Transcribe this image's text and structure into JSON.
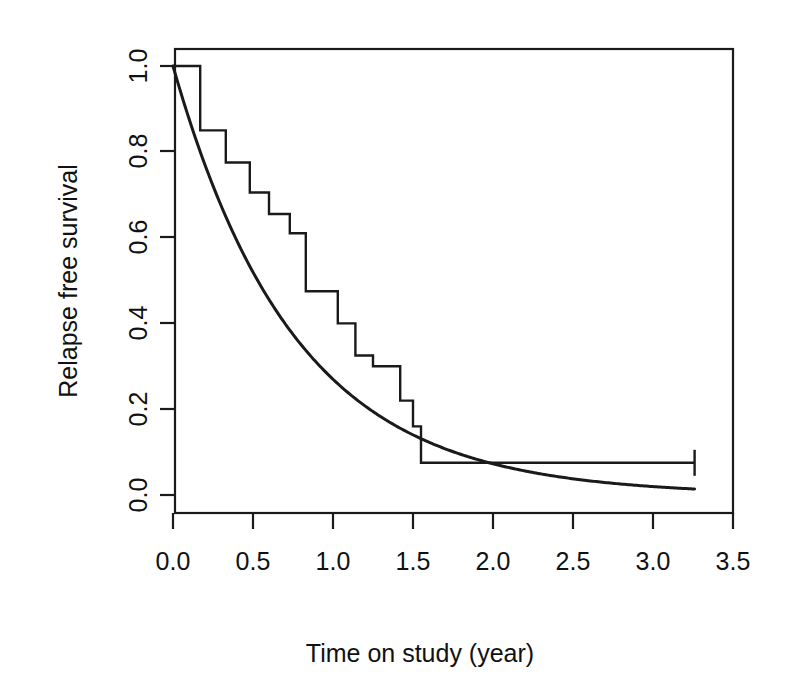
{
  "chart_data": {
    "type": "line",
    "title": "",
    "subtitle": "",
    "xlabel": "Time on study (year)",
    "ylabel": "Relapse free survival",
    "xlim": [
      0.0,
      3.5
    ],
    "ylim": [
      0.0,
      1.0
    ],
    "xticks": [
      0.0,
      0.5,
      1.0,
      1.5,
      2.0,
      2.5,
      3.0,
      3.5
    ],
    "xtick_labels": [
      "0.0",
      "0.5",
      "1.0",
      "1.5",
      "2.0",
      "2.5",
      "3.0",
      "3.5"
    ],
    "yticks": [
      0.0,
      0.2,
      0.4,
      0.6,
      0.8,
      1.0
    ],
    "ytick_labels": [
      "0.0",
      "0.2",
      "0.4",
      "0.6",
      "0.8",
      "1.0"
    ],
    "grid": false,
    "legend": "none",
    "line_color": "#1a1a1a",
    "background_color": "#ffffff",
    "series": [
      {
        "name": "Kaplan-Meier estimate",
        "style": "step-post",
        "x": [
          0.0,
          0.17,
          0.17,
          0.33,
          0.33,
          0.48,
          0.48,
          0.6,
          0.6,
          0.73,
          0.73,
          0.83,
          0.83,
          1.03,
          1.03,
          1.14,
          1.14,
          1.25,
          1.25,
          1.42,
          1.42,
          1.5,
          1.5,
          1.55,
          1.55,
          3.26
        ],
        "y": [
          1.0,
          1.0,
          0.85,
          0.85,
          0.775,
          0.775,
          0.705,
          0.705,
          0.655,
          0.655,
          0.61,
          0.61,
          0.475,
          0.475,
          0.4,
          0.4,
          0.325,
          0.325,
          0.3,
          0.3,
          0.22,
          0.22,
          0.16,
          0.16,
          0.075,
          0.075
        ],
        "censored_points": [
          {
            "x": 3.26,
            "y": 0.075
          }
        ]
      },
      {
        "name": "Fitted exponential survival",
        "style": "smooth",
        "model": "exponential",
        "rate": 1.31,
        "x": [
          0.0,
          0.25,
          0.5,
          0.75,
          1.0,
          1.25,
          1.5,
          1.75,
          2.0,
          2.25,
          2.5,
          2.75,
          3.0,
          3.26
        ],
        "y": [
          1.0,
          0.721,
          0.519,
          0.375,
          0.27,
          0.194,
          0.14,
          0.101,
          0.073,
          0.052,
          0.038,
          0.027,
          0.02,
          0.014
        ]
      }
    ],
    "annotations": []
  },
  "axes": {
    "x_title": "Time on study (year)",
    "y_title": "Relapse free survival"
  }
}
